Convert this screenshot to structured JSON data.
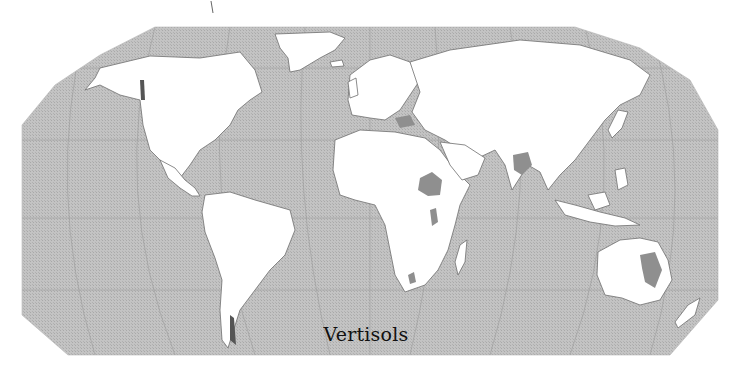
{
  "map": {
    "title": "Vertisols",
    "projection": "Robinson",
    "colors": {
      "ocean": "#bdbdbd",
      "land": "#ffffff",
      "border": "#6e6e6e",
      "soil_highlight": "#8f8f8f",
      "graticule": "#9a9a9a",
      "title_text": "#111111"
    },
    "legend": {
      "highlighted_class": "Vertisols"
    }
  }
}
